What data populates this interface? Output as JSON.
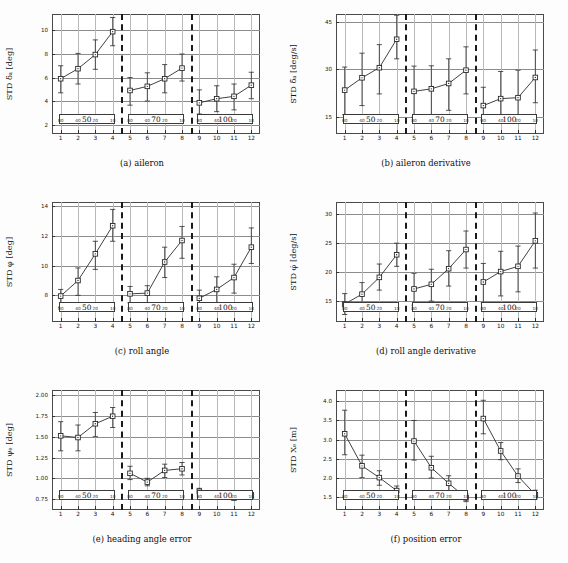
{
  "figure": {
    "inner_tick_labels": [
      "80",
      "40",
      "20",
      "10"
    ],
    "group_labels": [
      "50",
      "70",
      "100"
    ],
    "x_tick_labels": [
      "1",
      "2",
      "3",
      "4",
      "5",
      "6",
      "7",
      "8",
      "9",
      "10",
      "11",
      "12"
    ]
  },
  "chart_data": [
    {
      "id": "a",
      "type": "scatter",
      "caption": "(a) aileron",
      "ylabel": "STD δₐ [deg]",
      "xlabel": "",
      "ylim": [
        1.2,
        11.4
      ],
      "yticks": [
        2,
        4,
        6,
        8,
        10
      ],
      "ytick_labels": [
        "2",
        "4",
        "6",
        "8",
        "10"
      ],
      "x": [
        1,
        2,
        3,
        4,
        5,
        6,
        7,
        8,
        9,
        10,
        11,
        12
      ],
      "values": [
        5.9,
        6.75,
        7.95,
        9.9,
        4.9,
        5.25,
        5.9,
        6.8,
        3.85,
        4.2,
        4.4,
        5.35
      ],
      "err_low": [
        1.2,
        1.3,
        1.25,
        1.2,
        1.25,
        1.25,
        1.2,
        1.1,
        0.95,
        1.1,
        1.15,
        1.15
      ],
      "err_high": [
        1.1,
        1.3,
        1.25,
        1.2,
        1.1,
        1.15,
        1.2,
        1.2,
        1.1,
        1.1,
        1.05,
        1.1
      ],
      "grid": true,
      "legend_position": "none"
    },
    {
      "id": "b",
      "type": "scatter",
      "caption": "(b) aileron derivative",
      "ylabel": "STD δ̇ₐ [deg/s]",
      "xlabel": "",
      "ylim": [
        9.5,
        47.5
      ],
      "yticks": [
        15,
        30,
        45
      ],
      "ytick_labels": [
        "15",
        "30",
        "45"
      ],
      "x": [
        1,
        2,
        3,
        4,
        5,
        6,
        7,
        8,
        9,
        10,
        11,
        12
      ],
      "values": [
        23.4,
        27.3,
        30.5,
        39.5,
        23.0,
        23.8,
        25.5,
        29.7,
        18.5,
        20.7,
        21.0,
        27.4
      ],
      "err_low": [
        7.8,
        8.8,
        8.3,
        6.2,
        8.2,
        8.2,
        8.5,
        7.5,
        4.6,
        6.0,
        6.4,
        8.0
      ],
      "err_high": [
        7.3,
        7.8,
        7.3,
        7.6,
        8.0,
        7.3,
        7.8,
        7.4,
        5.8,
        8.6,
        8.7,
        8.7
      ],
      "grid": true,
      "legend_position": "none"
    },
    {
      "id": "c",
      "type": "scatter",
      "caption": "(c) roll angle",
      "ylabel": "STD φ [deg]",
      "xlabel": "",
      "ylim": [
        6.2,
        14.3
      ],
      "yticks": [
        8,
        10,
        12,
        14
      ],
      "ytick_labels": [
        "8",
        "10",
        "12",
        "14"
      ],
      "x": [
        1,
        2,
        3,
        4,
        5,
        6,
        7,
        8,
        9,
        10,
        11,
        12
      ],
      "values": [
        7.95,
        9.0,
        10.8,
        12.7,
        8.1,
        8.15,
        10.25,
        11.7,
        7.8,
        8.4,
        9.2,
        11.25
      ],
      "err_low": [
        0.75,
        1.0,
        1.05,
        1.05,
        0.6,
        0.7,
        1.05,
        1.2,
        0.7,
        0.95,
        1.05,
        1.1
      ],
      "err_high": [
        0.45,
        0.85,
        0.85,
        1.1,
        0.5,
        0.5,
        1.0,
        0.95,
        0.55,
        0.85,
        0.9,
        1.3
      ],
      "grid": true,
      "legend_position": "none"
    },
    {
      "id": "d",
      "type": "scatter",
      "caption": "(d) roll angle derivative",
      "ylabel": "STD φ̇ [deg/s]",
      "xlabel": "",
      "ylim": [
        11.3,
        32.0
      ],
      "yticks": [
        15,
        20,
        25,
        30
      ],
      "ytick_labels": [
        "15",
        "20",
        "25",
        "30"
      ],
      "x": [
        1,
        2,
        3,
        4,
        5,
        6,
        7,
        8,
        9,
        10,
        11,
        12
      ],
      "values": [
        14.4,
        16.1,
        19.0,
        22.9,
        17.0,
        17.8,
        20.5,
        23.8,
        18.2,
        20.0,
        20.9,
        25.3
      ],
      "err_low": [
        1.8,
        2.0,
        2.2,
        2.0,
        2.8,
        2.9,
        3.0,
        3.2,
        3.6,
        4.2,
        4.4,
        4.7
      ],
      "err_high": [
        1.8,
        2.0,
        2.3,
        2.0,
        2.7,
        2.6,
        3.1,
        3.2,
        3.2,
        3.5,
        3.5,
        4.8
      ],
      "grid": true,
      "legend_position": "none"
    },
    {
      "id": "e",
      "type": "scatter",
      "caption": "(e) heading angle error",
      "ylabel": "STD ψₑ [deg]",
      "xlabel": "",
      "ylim": [
        0.62,
        2.06
      ],
      "yticks": [
        0.75,
        1.0,
        1.25,
        1.5,
        1.75,
        2.0
      ],
      "ytick_labels": [
        "0.75",
        "1.00",
        "1.25",
        "1.50",
        "1.75",
        "2.00"
      ],
      "x": [
        1,
        2,
        3,
        4,
        5,
        6,
        7,
        8,
        9,
        10,
        11,
        12
      ],
      "values": [
        1.51,
        1.49,
        1.655,
        1.745,
        1.06,
        0.955,
        1.095,
        1.115,
        0.845,
        0.785,
        0.765,
        0.795
      ],
      "err_low": [
        0.18,
        0.16,
        0.155,
        0.135,
        0.075,
        0.045,
        0.085,
        0.075,
        0.035,
        0.025,
        0.025,
        0.035
      ],
      "err_high": [
        0.17,
        0.15,
        0.135,
        0.105,
        0.085,
        0.045,
        0.075,
        0.075,
        0.035,
        0.025,
        0.025,
        0.035
      ],
      "grid": true,
      "legend_position": "none"
    },
    {
      "id": "f",
      "type": "scatter",
      "caption": "(f) position error",
      "ylabel": "STD Xₑ [m]",
      "xlabel": "",
      "ylim": [
        1.15,
        4.3
      ],
      "yticks": [
        1.5,
        2.0,
        2.5,
        3.0,
        3.5,
        4.0
      ],
      "ytick_labels": [
        "1.5",
        "2.0",
        "2.5",
        "3.0",
        "3.5",
        "4.0"
      ],
      "x": [
        1,
        2,
        3,
        4,
        5,
        6,
        7,
        8,
        9,
        10,
        11,
        12
      ],
      "values": [
        3.15,
        2.31,
        2.0,
        1.66,
        2.96,
        2.26,
        1.85,
        1.47,
        3.55,
        2.7,
        2.04,
        1.55
      ],
      "err_low": [
        0.55,
        0.31,
        0.2,
        0.13,
        0.5,
        0.27,
        0.22,
        0.1,
        0.4,
        0.23,
        0.17,
        0.11
      ],
      "err_high": [
        0.62,
        0.28,
        0.18,
        0.12,
        0.54,
        0.3,
        0.2,
        0.1,
        0.48,
        0.22,
        0.19,
        0.12
      ],
      "grid": true,
      "legend_position": "none"
    }
  ]
}
